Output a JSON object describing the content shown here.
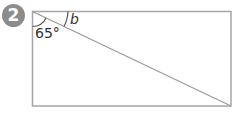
{
  "problem": {
    "number": "2",
    "badge_color": "#8c8c8c"
  },
  "figure": {
    "shape": "rectangle with diagonal from top-left to bottom-right",
    "line_color": "#a6a6a6",
    "angles": [
      {
        "label": "65°",
        "position": "top-left corner, between left side and diagonal"
      },
      {
        "label": "b",
        "position": "top-left corner, between top side and diagonal",
        "italic": true
      }
    ]
  }
}
